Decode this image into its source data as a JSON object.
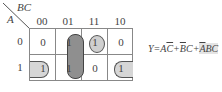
{
  "kmap": {
    "row_var": "A",
    "col_var": "BC",
    "col_headers": [
      "00",
      "01",
      "11",
      "10"
    ],
    "row_headers": [
      "0",
      "1"
    ],
    "cells": [
      [
        "0",
        "1",
        "1",
        "0"
      ],
      [
        "1",
        "1",
        "0",
        "1"
      ]
    ],
    "groups": [
      {
        "name": "column-01-pair",
        "cells": [
          [
            0,
            1
          ],
          [
            1,
            1
          ]
        ],
        "shade": "#8f8f8f"
      },
      {
        "name": "single-011",
        "cells": [
          [
            0,
            2
          ]
        ],
        "shade": "#cfcfcf"
      },
      {
        "name": "wraparound-row1",
        "cells": [
          [
            1,
            0
          ],
          [
            1,
            3
          ]
        ],
        "shade": "#d6d6d6"
      }
    ]
  },
  "expression": {
    "lhs": "Y=",
    "t1a": "A",
    "t1b": "C",
    "plus1": "+",
    "t2a": "B",
    "t2b": "C",
    "plus2": "+",
    "t3a": "A",
    "t3b": "BC"
  }
}
